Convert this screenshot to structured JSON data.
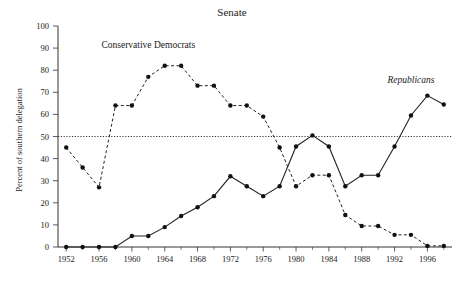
{
  "chart_data": {
    "type": "line",
    "title": "Senate",
    "xlabel": "",
    "ylabel": "Percent of southern delegation",
    "xlim": [
      1951,
      1999
    ],
    "ylim": [
      0,
      100
    ],
    "ytick_step": 10,
    "yticks": [
      0,
      10,
      20,
      30,
      40,
      50,
      60,
      70,
      80,
      90,
      100
    ],
    "ytick_labels": [
      "0",
      "10",
      "20",
      "30",
      "40",
      "50",
      "60",
      "70",
      "80",
      "90",
      "100"
    ],
    "xticks": [
      1952,
      1956,
      1960,
      1964,
      1968,
      1972,
      1976,
      1980,
      1984,
      1988,
      1992,
      1996
    ],
    "xtick_labels": [
      "1952",
      "1956",
      "1960",
      "1964",
      "1968",
      "1972",
      "1976",
      "1980",
      "1984",
      "1988",
      "1992",
      "1996"
    ],
    "x_minor_step": 2,
    "grid": false,
    "legend_position": "inline-annotations",
    "reference_line": {
      "value": 50,
      "style": "dotted",
      "label": ""
    },
    "x": [
      1952,
      1954,
      1956,
      1958,
      1960,
      1962,
      1964,
      1966,
      1968,
      1970,
      1972,
      1974,
      1976,
      1978,
      1980,
      1982,
      1984,
      1986,
      1988,
      1990,
      1992,
      1994,
      1996,
      1998
    ],
    "series": [
      {
        "name": "Conservative Democrats",
        "style": "dashed",
        "marker": "circle",
        "color": "#222222",
        "label_x": 1962,
        "label_y": 90,
        "italic": false,
        "values": [
          45.0,
          36.0,
          27.0,
          64.0,
          64.0,
          77.0,
          82.0,
          82.0,
          73.0,
          73.0,
          64.0,
          64.0,
          59.0,
          45.0,
          27.5,
          32.5,
          32.5,
          14.5,
          9.5,
          9.5,
          5.5,
          5.5,
          0.5,
          0.5
        ]
      },
      {
        "name": "Republicans",
        "style": "solid",
        "marker": "circle",
        "color": "#222222",
        "label_x": 1994,
        "label_y": 74,
        "italic": true,
        "values": [
          0.0,
          0.0,
          0.0,
          0.0,
          5.0,
          5.0,
          9.0,
          14.0,
          18.0,
          23.0,
          32.0,
          27.5,
          23.0,
          27.5,
          45.5,
          50.5,
          45.5,
          27.5,
          32.5,
          32.5,
          45.5,
          59.5,
          68.5,
          64.5
        ]
      }
    ]
  }
}
